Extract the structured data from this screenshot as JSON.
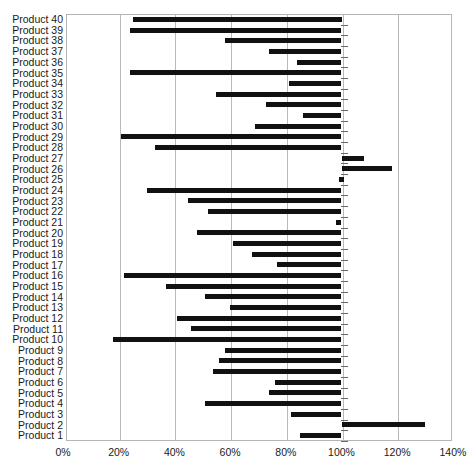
{
  "chart_data": {
    "type": "bar",
    "orientation": "horizontal",
    "title": "",
    "xlabel": "",
    "ylabel": "",
    "xlim": [
      -1,
      141
    ],
    "xticks": [
      0,
      20,
      40,
      60,
      80,
      100,
      120,
      140
    ],
    "xtick_labels": [
      "0%",
      "20%",
      "40%",
      "60%",
      "80%",
      "100%",
      "120%",
      "140%"
    ],
    "grid": true,
    "grid_axis": "x",
    "bar_color": "#111111",
    "baseline": 100,
    "note": "Floating horizontal bars: each bar spans from its start value to its end value (most end at 100%).",
    "categories": [
      "Product 40",
      "Product 39",
      "Product 38",
      "Product 37",
      "Product 36",
      "Product 35",
      "Product 34",
      "Product 33",
      "Product 32",
      "Product 31",
      "Product 30",
      "Product 29",
      "Product 28",
      "Product 27",
      "Product 26",
      "Product 25",
      "Product 24",
      "Product 23",
      "Product 22",
      "Product 21",
      "Product 20",
      "Product 19",
      "Product 18",
      "Product 17",
      "Product 16",
      "Product 15",
      "Product 14",
      "Product 13",
      "Product 12",
      "Product 11",
      "Product 10",
      "Product 9",
      "Product 8",
      "Product 7",
      "Product 6",
      "Product 5",
      "Product 4",
      "Product 3",
      "Product 2",
      "Product 1"
    ],
    "bars": [
      {
        "label": "Product 40",
        "start": 25,
        "end": 100
      },
      {
        "label": "Product 39",
        "start": 24,
        "end": 100
      },
      {
        "label": "Product 38",
        "start": 58,
        "end": 100
      },
      {
        "label": "Product 37",
        "start": 74,
        "end": 100
      },
      {
        "label": "Product 36",
        "start": 84,
        "end": 100
      },
      {
        "label": "Product 35",
        "start": 24,
        "end": 100
      },
      {
        "label": "Product 34",
        "start": 81,
        "end": 100
      },
      {
        "label": "Product 33",
        "start": 55,
        "end": 100
      },
      {
        "label": "Product 32",
        "start": 73,
        "end": 100
      },
      {
        "label": "Product 31",
        "start": 86,
        "end": 100
      },
      {
        "label": "Product 30",
        "start": 69,
        "end": 100
      },
      {
        "label": "Product 29",
        "start": 21,
        "end": 100
      },
      {
        "label": "Product 28",
        "start": 33,
        "end": 100
      },
      {
        "label": "Product 27",
        "start": 100,
        "end": 108
      },
      {
        "label": "Product 26",
        "start": 100,
        "end": 118
      },
      {
        "label": "Product 25",
        "start": 99,
        "end": 101
      },
      {
        "label": "Product 24",
        "start": 30,
        "end": 100
      },
      {
        "label": "Product 23",
        "start": 45,
        "end": 100
      },
      {
        "label": "Product 22",
        "start": 52,
        "end": 100
      },
      {
        "label": "Product 21",
        "start": 98,
        "end": 100
      },
      {
        "label": "Product 20",
        "start": 48,
        "end": 100
      },
      {
        "label": "Product 19",
        "start": 61,
        "end": 100
      },
      {
        "label": "Product 18",
        "start": 68,
        "end": 100
      },
      {
        "label": "Product 17",
        "start": 77,
        "end": 100
      },
      {
        "label": "Product 16",
        "start": 22,
        "end": 100
      },
      {
        "label": "Product 15",
        "start": 37,
        "end": 100
      },
      {
        "label": "Product 14",
        "start": 51,
        "end": 100
      },
      {
        "label": "Product 13",
        "start": 60,
        "end": 100
      },
      {
        "label": "Product 12",
        "start": 41,
        "end": 100
      },
      {
        "label": "Product 11",
        "start": 46,
        "end": 100
      },
      {
        "label": "Product 10",
        "start": 18,
        "end": 100
      },
      {
        "label": "Product 9",
        "start": 58,
        "end": 100
      },
      {
        "label": "Product 8",
        "start": 56,
        "end": 100
      },
      {
        "label": "Product 7",
        "start": 54,
        "end": 100
      },
      {
        "label": "Product 6",
        "start": 76,
        "end": 100
      },
      {
        "label": "Product 5",
        "start": 74,
        "end": 100
      },
      {
        "label": "Product 4",
        "start": 51,
        "end": 100
      },
      {
        "label": "Product 3",
        "start": 82,
        "end": 100
      },
      {
        "label": "Product 2",
        "start": 100,
        "end": 130
      },
      {
        "label": "Product 1",
        "start": 85,
        "end": 100
      }
    ]
  }
}
